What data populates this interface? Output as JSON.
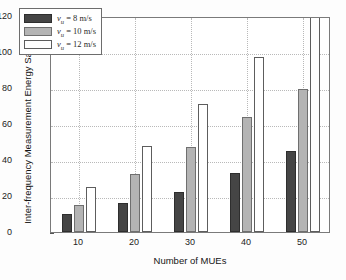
{
  "chart_data": {
    "type": "bar",
    "title": "",
    "xlabel": "Number of MUEs",
    "ylabel": "Inter-frequency Measurement Energy Saving (mJ)",
    "categories": [
      "10",
      "20",
      "30",
      "40",
      "50"
    ],
    "ylim": [
      0,
      120
    ],
    "yticks": [
      "0",
      "20",
      "40",
      "60",
      "80",
      "100",
      "120"
    ],
    "grid": true,
    "legend_position": "upper left",
    "series": [
      {
        "name": "v_u = 8 m/s",
        "symbol": "v",
        "subscript": "u",
        "speed": "8",
        "unit": "m/s",
        "color": "#454545",
        "values": [
          10,
          16,
          22,
          33,
          45
        ]
      },
      {
        "name": "v_u = 10 m/s",
        "symbol": "v",
        "subscript": "u",
        "speed": "10",
        "unit": "m/s",
        "color": "#b4b4b4",
        "values": [
          15,
          32,
          47,
          64,
          79.5
        ]
      },
      {
        "name": "v_u = 12 m/s",
        "symbol": "v",
        "subscript": "u",
        "speed": "12",
        "unit": "m/s",
        "color": "#ffffff",
        "values": [
          25,
          48,
          71,
          97,
          120
        ]
      }
    ]
  },
  "legend": {
    "items": [
      {
        "equals": "=",
        "symbol": "v",
        "subscript": "u",
        "speed": "8",
        "unit": "m/s"
      },
      {
        "equals": "=",
        "symbol": "v",
        "subscript": "u",
        "speed": "10",
        "unit": "m/s"
      },
      {
        "equals": "=",
        "symbol": "v",
        "subscript": "u",
        "speed": "12",
        "unit": "m/s"
      }
    ]
  }
}
